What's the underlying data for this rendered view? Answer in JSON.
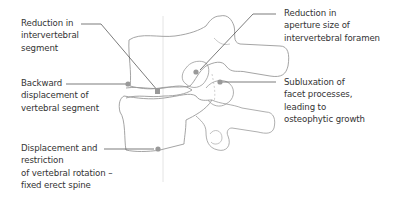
{
  "diagram": {
    "type": "anatomical-illustration",
    "colors": {
      "text": "#333333",
      "leader_line": "#444444",
      "bone_outline": "#9a9a9a",
      "marker_dot": "#999999",
      "axis_line": "#dddddd",
      "background": "#ffffff"
    },
    "labels": [
      {
        "id": "reduction-intervertebral-segment",
        "lines": [
          "Reduction in",
          "intervertebral",
          "segment"
        ]
      },
      {
        "id": "backward-displacement",
        "lines": [
          "Backward",
          "displacement of",
          "vertebral segment"
        ]
      },
      {
        "id": "displacement-restriction-rotation",
        "lines": [
          "Displacement and",
          "restriction",
          "of vertebral rotation –",
          "fixed erect spine"
        ]
      },
      {
        "id": "reduction-aperture-foramen",
        "lines": [
          "Reduction in",
          "aperture size of",
          "intervertebral foramen"
        ]
      },
      {
        "id": "subluxation-facet",
        "lines": [
          "Subluxation of",
          "facet processes,",
          "leading to",
          "osteophytic growth"
        ]
      }
    ]
  }
}
